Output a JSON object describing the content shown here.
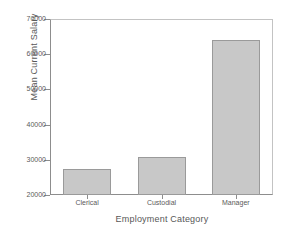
{
  "chart_data": {
    "type": "bar",
    "title": "",
    "categories": [
      "Clerical",
      "Custodial",
      "Manager"
    ],
    "values": [
      27500,
      30900,
      64000
    ],
    "xlabel": "Employment Category",
    "ylabel": "Mean Current Salary",
    "ylim": [
      20000,
      70000
    ],
    "yticks": [
      "20000",
      "30000",
      "40000",
      "50000",
      "60000",
      "70000"
    ],
    "ytick_values": [
      20000,
      30000,
      40000,
      50000,
      60000,
      70000
    ],
    "grid": false,
    "legend": "none",
    "bar_color": "#c8c8c8",
    "bar_border_color": "#9a9a9a",
    "axis_color": "#8d8d8d",
    "frame_color": "#c3c3c3",
    "background": "#ffffff",
    "text_color": "#585858"
  }
}
